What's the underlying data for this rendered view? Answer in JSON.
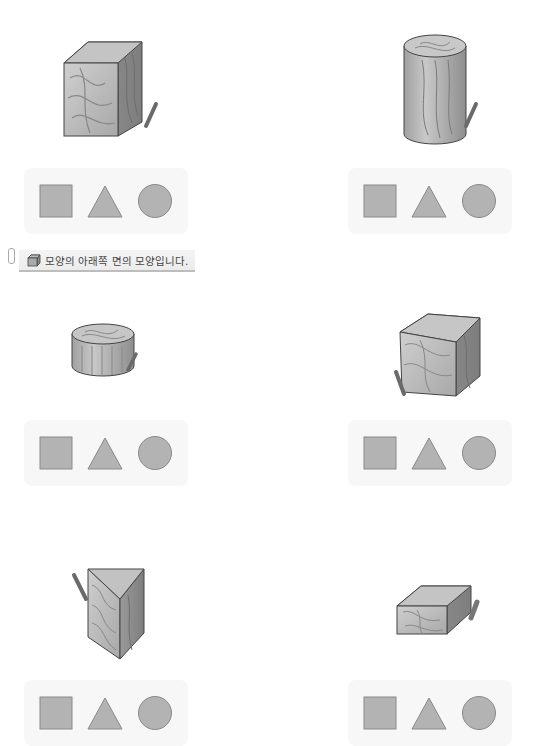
{
  "note": {
    "icon": "cube-icon",
    "text": "모양의 아래쪽 면의 모양입니다."
  },
  "options": [
    "square",
    "triangle",
    "circle"
  ],
  "colors": {
    "shape_fill": "#b3b3b3",
    "shape_stroke": "#8a8a8a",
    "strip_bg": "#f7f7f7",
    "wood_light": "#c9c9c9",
    "wood_dark": "#8c8c8c"
  },
  "problems": [
    {
      "id": 1,
      "solid": "cube",
      "options": [
        "square",
        "triangle",
        "circle"
      ]
    },
    {
      "id": 2,
      "solid": "cylinder-tall",
      "options": [
        "square",
        "triangle",
        "circle"
      ]
    },
    {
      "id": 3,
      "solid": "cylinder-short",
      "options": [
        "square",
        "triangle",
        "circle"
      ]
    },
    {
      "id": 4,
      "solid": "cube",
      "options": [
        "square",
        "triangle",
        "circle"
      ]
    },
    {
      "id": 5,
      "solid": "triangular-prism",
      "options": [
        "square",
        "triangle",
        "circle"
      ]
    },
    {
      "id": 6,
      "solid": "rectangular-box",
      "options": [
        "square",
        "triangle",
        "circle"
      ]
    }
  ]
}
